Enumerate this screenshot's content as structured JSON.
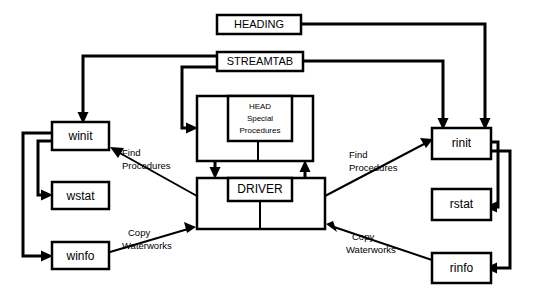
{
  "diagram": {
    "colors": {
      "background": "#ffffff",
      "line": "#000000",
      "text": "#000000"
    },
    "nodes": [
      {
        "id": "heading",
        "label": "HEADING",
        "x": 217,
        "y": 15,
        "w": 84,
        "h": 19,
        "font_size": 11,
        "bold": false
      },
      {
        "id": "streamtab",
        "label": "STREAMTAB",
        "x": 217,
        "y": 52,
        "w": 86,
        "h": 19,
        "font_size": 11,
        "bold": false
      },
      {
        "id": "winit",
        "label": "winit",
        "x": 52,
        "y": 122,
        "w": 57,
        "h": 28,
        "font_size": 12,
        "bold": false
      },
      {
        "id": "wstat",
        "label": "wstat",
        "x": 52,
        "y": 182,
        "w": 57,
        "h": 27,
        "font_size": 12,
        "bold": false
      },
      {
        "id": "winfo",
        "label": "winfo",
        "x": 52,
        "y": 242,
        "w": 57,
        "h": 27,
        "font_size": 12,
        "bold": false
      },
      {
        "id": "rinit",
        "label": "rinit",
        "x": 432,
        "y": 128,
        "w": 59,
        "h": 31,
        "font_size": 12,
        "bold": false
      },
      {
        "id": "rstat",
        "label": "rstat",
        "x": 432,
        "y": 189,
        "w": 59,
        "h": 31,
        "font_size": 12,
        "bold": false
      },
      {
        "id": "rinfo",
        "label": "rinfo",
        "x": 432,
        "y": 253,
        "w": 59,
        "h": 30,
        "font_size": 12,
        "bold": false
      },
      {
        "id": "head-outer",
        "label": "",
        "x": 197,
        "y": 96,
        "w": 116,
        "h": 65,
        "font_size": 0,
        "bold": false
      },
      {
        "id": "driver-outer",
        "label": "",
        "x": 197,
        "y": 178,
        "w": 128,
        "h": 51,
        "font_size": 0,
        "bold": false
      }
    ],
    "inner_nodes": [
      {
        "id": "head-inner",
        "lines": [
          "HEAD",
          "Special",
          "Procedures"
        ],
        "x": 228,
        "y": 96,
        "w": 64,
        "h": 45,
        "font_size": 8
      },
      {
        "id": "driver-inner",
        "lines": [
          "DRIVER"
        ],
        "x": 228,
        "y": 178,
        "w": 64,
        "h": 23,
        "font_size": 12
      }
    ],
    "edge_labels": [
      {
        "id": "find-procedures-left",
        "lines": [
          "Find",
          "Procedures"
        ],
        "x": 122,
        "y": 152,
        "font_size": 9.5
      },
      {
        "id": "copy-waterworks-left",
        "lines": [
          "Copy",
          "Waterworks"
        ],
        "x": 128,
        "y": 232,
        "font_size": 9.5
      },
      {
        "id": "find-procedures-right",
        "lines": [
          "Find",
          "Procedures"
        ],
        "x": 348,
        "y": 154,
        "font_size": 9.5
      },
      {
        "id": "copy-waterworks-right",
        "lines": [
          "Copy",
          "Waterworks"
        ],
        "x": 348,
        "y": 236,
        "font_size": 9.5
      }
    ],
    "edges": [
      {
        "id": "heading-to-rinit",
        "from": "heading",
        "to": "rinit",
        "label": ""
      },
      {
        "id": "streamtab-to-rinit",
        "from": "streamtab",
        "to": "rinit",
        "label": ""
      },
      {
        "id": "streamtab-to-winit",
        "from": "streamtab",
        "to": "winit",
        "label": ""
      },
      {
        "id": "streamtab-to-head",
        "from": "streamtab",
        "to": "head-outer",
        "label": ""
      },
      {
        "id": "winit-to-wstat",
        "from": "winit",
        "to": "wstat",
        "label": ""
      },
      {
        "id": "winit-to-winfo",
        "from": "winit",
        "to": "winfo",
        "label": ""
      },
      {
        "id": "rinit-to-rstat",
        "from": "rinit",
        "to": "rstat",
        "label": ""
      },
      {
        "id": "rinit-to-rinfo",
        "from": "rinit",
        "to": "rinfo",
        "label": ""
      },
      {
        "id": "head-to-driver",
        "from": "head-outer",
        "to": "driver-outer",
        "label": ""
      },
      {
        "id": "driver-to-head",
        "from": "driver-outer",
        "to": "head-outer",
        "label": ""
      },
      {
        "id": "driver-to-winit",
        "from": "driver-outer",
        "to": "winit",
        "label": "Find Procedures"
      },
      {
        "id": "winfo-to-driver",
        "from": "winfo",
        "to": "driver-outer",
        "label": "Copy Waterworks"
      },
      {
        "id": "driver-to-rinit",
        "from": "driver-outer",
        "to": "rinit",
        "label": "Find Procedures"
      },
      {
        "id": "rinfo-to-driver",
        "from": "rinfo",
        "to": "driver-outer",
        "label": "Copy Waterworks"
      }
    ]
  }
}
